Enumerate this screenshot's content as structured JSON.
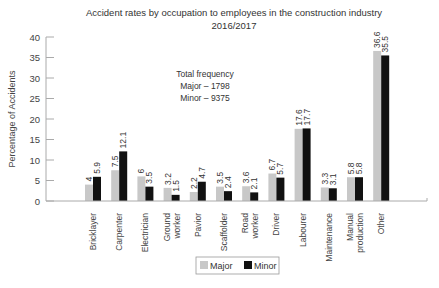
{
  "chart_data": {
    "type": "bar",
    "title": "Accident rates by occupation to employees in the construction industry",
    "subtitle": "2016/2017",
    "xlabel": "",
    "ylabel": "Percentage of Accidents",
    "ylim": [
      0,
      40
    ],
    "yticks": [
      0,
      5,
      10,
      15,
      20,
      25,
      30,
      35,
      40
    ],
    "grid": false,
    "legend_position": "bottom",
    "categories": [
      [
        "Bricklayer"
      ],
      [
        "Carpenter"
      ],
      [
        "Electrician"
      ],
      [
        "Ground",
        "worker"
      ],
      [
        "Pavior"
      ],
      [
        "Scaffolder"
      ],
      [
        "Road",
        "worker"
      ],
      [
        "Driver"
      ],
      [
        "Labourer"
      ],
      [
        "Maintenance"
      ],
      [
        "Manual",
        "production"
      ],
      [
        "Other"
      ]
    ],
    "series": [
      {
        "name": "Major",
        "color": "#c8c8c8",
        "values": [
          4,
          7.5,
          6,
          3.2,
          2.2,
          3.5,
          3.6,
          6.7,
          17.6,
          3.3,
          5.8,
          36.6
        ],
        "labels": [
          "4",
          "7.5",
          "6",
          "3.2",
          "2.2",
          "3.5",
          "3.6",
          "6.7",
          "17.6",
          "3.3",
          "5.8",
          "36.6"
        ]
      },
      {
        "name": "Minor",
        "color": "#111111",
        "values": [
          5.9,
          12.1,
          3.5,
          1.5,
          4.7,
          2.4,
          2.1,
          5.7,
          17.7,
          3.1,
          5.8,
          35.5
        ],
        "labels": [
          "5.9",
          "12.1",
          "3.5",
          "1.5",
          "4.7",
          "2.4",
          "2.1",
          "5.7",
          "17.7",
          "3.1",
          "5.8",
          "35.5"
        ]
      }
    ],
    "annotation": [
      "Total frequency",
      "Major – 1798",
      "Minor – 9375"
    ]
  }
}
